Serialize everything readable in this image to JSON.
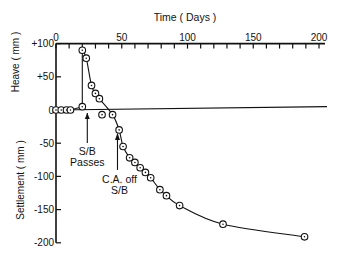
{
  "chart_data": {
    "type": "line",
    "title": "",
    "xlabel": "Time ( Days )",
    "ylabel_top": "Heave ( mm )",
    "ylabel_bottom": "Settlement ( mm )",
    "x_ticks": [
      0,
      50,
      100,
      150,
      200
    ],
    "y_ticks": [
      {
        "value": 100,
        "label": "+100"
      },
      {
        "value": 50,
        "label": "+50"
      },
      {
        "value": 0,
        "label": "0"
      },
      {
        "value": -50,
        "label": "-50"
      },
      {
        "value": -100,
        "label": "-100"
      },
      {
        "value": -150,
        "label": "-150"
      },
      {
        "value": -200,
        "label": "-200"
      }
    ],
    "xlim": [
      0,
      200
    ],
    "ylim": [
      -200,
      100
    ],
    "grid": false,
    "x_axis_position": "top",
    "series": [
      {
        "name": "measured",
        "marker": "circle-dot",
        "points": [
          [
            0,
            0
          ],
          [
            4,
            0
          ],
          [
            8,
            0
          ],
          [
            11,
            0
          ],
          [
            20,
            5
          ],
          [
            20,
            90
          ],
          [
            23,
            78
          ],
          [
            27,
            37
          ],
          [
            30,
            25
          ],
          [
            33,
            17
          ],
          [
            43,
            -7
          ],
          [
            48,
            -30
          ],
          [
            51,
            -55
          ],
          [
            56,
            -72
          ],
          [
            60,
            -79
          ],
          [
            64,
            -87
          ],
          [
            68,
            -94
          ],
          [
            72,
            -102
          ],
          [
            79,
            -120
          ],
          [
            84,
            -129
          ],
          [
            94,
            -144
          ],
          [
            127,
            -172
          ],
          [
            189,
            -191
          ]
        ]
      },
      {
        "name": "outlier",
        "marker": "circle-dot",
        "points": [
          [
            35,
            -7
          ]
        ]
      }
    ],
    "reference_line": {
      "from": [
        0,
        0
      ],
      "to": [
        200,
        5
      ]
    },
    "annotations": [
      {
        "text": "S/B Passes",
        "lines": [
          "S/B",
          "Passes"
        ],
        "x": 20,
        "arrow_to_y": 0
      },
      {
        "text": "C.A. off S/B",
        "lines": [
          "C.A. off",
          "S/B"
        ],
        "x": 46,
        "arrow_to_y": -30
      }
    ]
  }
}
